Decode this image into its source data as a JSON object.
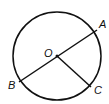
{
  "figure": {
    "type": "circle-geometry",
    "caption_partial": "",
    "center_label": "O",
    "points": [
      {
        "label": "A",
        "position": "upper-right on circle"
      },
      {
        "label": "B",
        "position": "lower-left on circle"
      },
      {
        "label": "C",
        "position": "lower-right on circle"
      }
    ],
    "segments": [
      {
        "from": "A",
        "to": "B",
        "kind": "diameter",
        "through": "O"
      },
      {
        "from": "O",
        "to": "C",
        "kind": "radius"
      }
    ],
    "colors": {
      "stroke": "#111111",
      "background": "#ffffff"
    }
  }
}
